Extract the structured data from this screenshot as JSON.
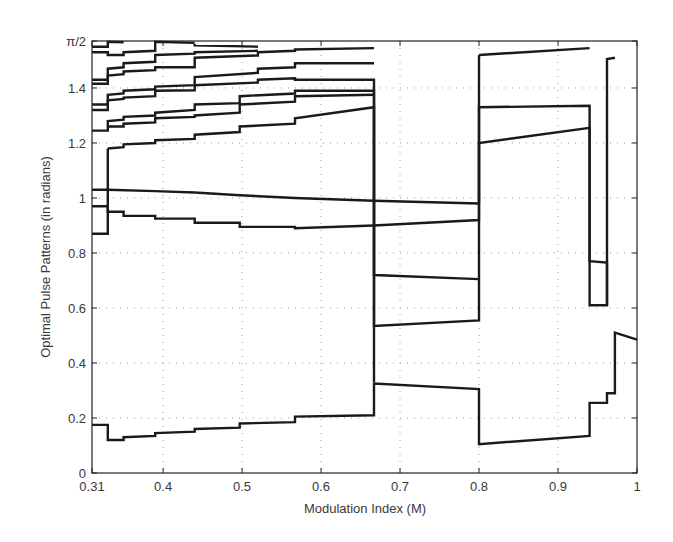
{
  "chart_data": {
    "type": "line",
    "title": "",
    "xlabel": "Modulation Index (M)",
    "ylabel": "Optimal Pulse Patterns (in radians)",
    "xlim": [
      0.31,
      1.0
    ],
    "ylim": [
      0,
      1.5708
    ],
    "grid": true,
    "legend": null,
    "x_ticks": [
      0.31,
      0.4,
      0.5,
      0.6,
      0.7,
      0.8,
      0.9,
      1.0
    ],
    "x_tick_labels": [
      "0.31",
      "0.4",
      "0.5",
      "0.6",
      "0.7",
      "0.8",
      "0.9",
      "1"
    ],
    "y_ticks": [
      0,
      0.2,
      0.4,
      0.6,
      0.8,
      1.0,
      1.2,
      1.4,
      1.5708
    ],
    "y_tick_labels": [
      "0",
      "0.2",
      "0.4",
      "0.6",
      "0.8",
      "1",
      "1.2",
      "1.4",
      "π/2"
    ],
    "line_color": "#1a1a1a",
    "grid_color": "#9a9a9a",
    "series": [
      {
        "name": "angle-top-1",
        "points": [
          [
            0.31,
            1.55
          ],
          [
            0.33,
            1.55
          ],
          [
            0.33,
            1.568
          ],
          [
            0.35,
            1.566
          ]
        ]
      },
      {
        "name": "angle-top-2",
        "points": [
          [
            0.31,
            1.53
          ],
          [
            0.33,
            1.53
          ],
          [
            0.33,
            1.52
          ],
          [
            0.35,
            1.52
          ],
          [
            0.35,
            1.53
          ],
          [
            0.39,
            1.535
          ],
          [
            0.39,
            1.568
          ],
          [
            0.44,
            1.564
          ]
        ]
      },
      {
        "name": "angle-top-3",
        "points": [
          [
            0.44,
            1.56
          ],
          [
            0.44,
            1.555
          ],
          [
            0.52,
            1.55
          ]
        ]
      },
      {
        "name": "angle-a",
        "points": [
          [
            0.31,
            1.43
          ],
          [
            0.33,
            1.43
          ],
          [
            0.33,
            1.47
          ],
          [
            0.35,
            1.475
          ],
          [
            0.35,
            1.49
          ],
          [
            0.39,
            1.495
          ],
          [
            0.39,
            1.52
          ],
          [
            0.44,
            1.525
          ],
          [
            0.44,
            1.53
          ],
          [
            0.52,
            1.535
          ]
        ]
      },
      {
        "name": "angle-b",
        "points": [
          [
            0.31,
            1.415
          ],
          [
            0.33,
            1.415
          ],
          [
            0.33,
            1.445
          ],
          [
            0.35,
            1.45
          ],
          [
            0.35,
            1.46
          ],
          [
            0.39,
            1.465
          ],
          [
            0.39,
            1.475
          ],
          [
            0.44,
            1.475
          ],
          [
            0.44,
            1.51
          ],
          [
            0.52,
            1.518
          ],
          [
            0.52,
            1.53
          ],
          [
            0.567,
            1.535
          ],
          [
            0.567,
            1.54
          ],
          [
            0.667,
            1.545
          ]
        ]
      },
      {
        "name": "angle-c",
        "points": [
          [
            0.31,
            1.34
          ],
          [
            0.33,
            1.34
          ],
          [
            0.33,
            1.375
          ],
          [
            0.35,
            1.38
          ],
          [
            0.35,
            1.39
          ],
          [
            0.39,
            1.395
          ],
          [
            0.39,
            1.405
          ],
          [
            0.44,
            1.41
          ],
          [
            0.44,
            1.44
          ],
          [
            0.52,
            1.455
          ],
          [
            0.52,
            1.47
          ],
          [
            0.567,
            1.475
          ],
          [
            0.567,
            1.49
          ],
          [
            0.667,
            1.49
          ]
        ]
      },
      {
        "name": "angle-d",
        "points": [
          [
            0.31,
            1.32
          ],
          [
            0.33,
            1.32
          ],
          [
            0.33,
            1.355
          ],
          [
            0.35,
            1.36
          ],
          [
            0.35,
            1.365
          ],
          [
            0.39,
            1.37
          ],
          [
            0.39,
            1.39
          ],
          [
            0.44,
            1.392
          ],
          [
            0.44,
            1.41
          ],
          [
            0.52,
            1.42
          ],
          [
            0.52,
            1.43
          ],
          [
            0.567,
            1.435
          ],
          [
            0.567,
            1.43
          ],
          [
            0.667,
            1.43
          ],
          [
            0.667,
            0.72
          ],
          [
            0.8,
            0.705
          ]
        ]
      },
      {
        "name": "angle-e",
        "points": [
          [
            0.31,
            1.245
          ],
          [
            0.33,
            1.245
          ],
          [
            0.33,
            1.28
          ],
          [
            0.35,
            1.285
          ],
          [
            0.35,
            1.295
          ],
          [
            0.39,
            1.3
          ],
          [
            0.39,
            1.31
          ],
          [
            0.44,
            1.32
          ],
          [
            0.44,
            1.34
          ],
          [
            0.497,
            1.345
          ],
          [
            0.497,
            1.37
          ],
          [
            0.567,
            1.38
          ],
          [
            0.567,
            1.39
          ],
          [
            0.667,
            1.39
          ],
          [
            0.667,
            0.535
          ],
          [
            0.8,
            0.555
          ],
          [
            0.8,
            1.33
          ],
          [
            0.94,
            1.335
          ],
          [
            0.94,
            0.61
          ],
          [
            0.962,
            0.61
          ],
          [
            0.962,
            1.505
          ],
          [
            0.972,
            1.51
          ]
        ]
      },
      {
        "name": "angle-f",
        "points": [
          [
            0.33,
            1.26
          ],
          [
            0.35,
            1.26
          ],
          [
            0.35,
            1.27
          ],
          [
            0.39,
            1.275
          ],
          [
            0.39,
            1.29
          ],
          [
            0.44,
            1.295
          ],
          [
            0.44,
            1.3
          ],
          [
            0.497,
            1.31
          ],
          [
            0.497,
            1.34
          ],
          [
            0.567,
            1.35
          ],
          [
            0.567,
            1.37
          ],
          [
            0.667,
            1.375
          ]
        ]
      },
      {
        "name": "angle-g",
        "points": [
          [
            0.33,
            1.18
          ],
          [
            0.35,
            1.185
          ],
          [
            0.35,
            1.195
          ],
          [
            0.39,
            1.2
          ],
          [
            0.39,
            1.21
          ],
          [
            0.44,
            1.215
          ],
          [
            0.44,
            1.23
          ],
          [
            0.497,
            1.24
          ],
          [
            0.497,
            1.26
          ],
          [
            0.567,
            1.27
          ],
          [
            0.567,
            1.29
          ],
          [
            0.667,
            1.33
          ],
          [
            0.667,
            0.33
          ]
        ]
      },
      {
        "name": "angle-h",
        "points": [
          [
            0.31,
            1.03
          ],
          [
            0.33,
            1.03
          ],
          [
            0.33,
            1.03
          ],
          [
            0.39,
            1.025
          ],
          [
            0.44,
            1.02
          ],
          [
            0.497,
            1.01
          ],
          [
            0.567,
            1.0
          ],
          [
            0.667,
            0.99
          ],
          [
            0.8,
            0.98
          ]
        ]
      },
      {
        "name": "angle-i",
        "points": [
          [
            0.31,
            0.97
          ],
          [
            0.33,
            0.97
          ],
          [
            0.33,
            0.95
          ],
          [
            0.35,
            0.95
          ],
          [
            0.35,
            0.935
          ],
          [
            0.39,
            0.935
          ],
          [
            0.39,
            0.925
          ],
          [
            0.44,
            0.925
          ],
          [
            0.44,
            0.91
          ],
          [
            0.497,
            0.91
          ],
          [
            0.497,
            0.895
          ],
          [
            0.567,
            0.895
          ],
          [
            0.567,
            0.89
          ],
          [
            0.667,
            0.9
          ],
          [
            0.8,
            0.92
          ],
          [
            0.8,
            1.2
          ],
          [
            0.94,
            1.255
          ],
          [
            0.94,
            0.77
          ],
          [
            0.962,
            0.765
          ],
          [
            0.962,
            0.61
          ]
        ]
      },
      {
        "name": "angle-j",
        "points": [
          [
            0.31,
            0.87
          ],
          [
            0.33,
            0.87
          ],
          [
            0.33,
            1.18
          ]
        ]
      },
      {
        "name": "angle-bottom",
        "points": [
          [
            0.31,
            0.175
          ],
          [
            0.33,
            0.175
          ],
          [
            0.33,
            0.12
          ],
          [
            0.35,
            0.12
          ],
          [
            0.35,
            0.13
          ],
          [
            0.39,
            0.135
          ],
          [
            0.39,
            0.145
          ],
          [
            0.44,
            0.15
          ],
          [
            0.44,
            0.16
          ],
          [
            0.497,
            0.165
          ],
          [
            0.497,
            0.18
          ],
          [
            0.567,
            0.185
          ],
          [
            0.567,
            0.205
          ],
          [
            0.667,
            0.21
          ],
          [
            0.667,
            0.325
          ],
          [
            0.8,
            0.305
          ],
          [
            0.8,
            0.105
          ],
          [
            0.94,
            0.135
          ],
          [
            0.94,
            0.255
          ],
          [
            0.962,
            0.255
          ],
          [
            0.962,
            0.29
          ],
          [
            0.972,
            0.29
          ],
          [
            0.972,
            0.51
          ],
          [
            1.0,
            0.485
          ]
        ]
      },
      {
        "name": "angle-late",
        "points": [
          [
            0.8,
            1.52
          ],
          [
            0.94,
            1.545
          ]
        ]
      },
      {
        "name": "angle-late-connector",
        "points": [
          [
            0.8,
            0.98
          ],
          [
            0.8,
            1.52
          ]
        ]
      }
    ]
  }
}
